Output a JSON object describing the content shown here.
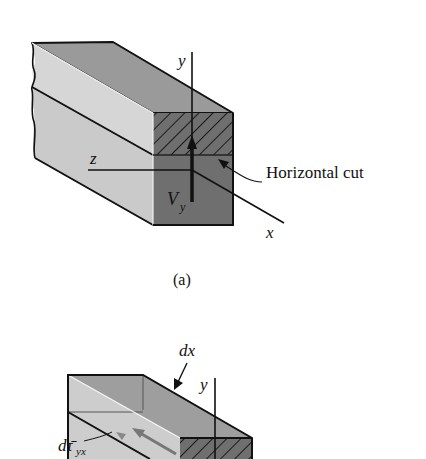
{
  "figure_a": {
    "caption": "(a)",
    "labels": {
      "y_axis": "y",
      "z_axis": "z",
      "x_axis": "x",
      "shear_force": "V",
      "shear_force_sub": "y",
      "cut_annotation": "Horizontal cut"
    }
  },
  "figure_b": {
    "labels": {
      "length": "dx",
      "y_axis": "y",
      "shear_stress": "dτ̄",
      "shear_stress_sub": "yx"
    }
  },
  "colors": {
    "top_face": "#9a9a9a",
    "side_face": "#cfcfcf",
    "end_face": "#6f6f6f",
    "outline": "#111111"
  }
}
